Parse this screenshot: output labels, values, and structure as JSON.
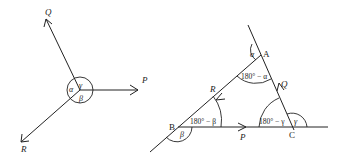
{
  "left_figure": {
    "vectors": [
      {
        "name": "P",
        "label": "P"
      },
      {
        "name": "Q",
        "label": "Q"
      },
      {
        "name": "R",
        "label": "R"
      }
    ],
    "angles": {
      "alpha": "α",
      "beta": "β",
      "gamma": "γ"
    }
  },
  "right_figure": {
    "vertices": {
      "A": "A",
      "B": "B",
      "C": "C"
    },
    "vectors": {
      "P": "P",
      "Q": "Q",
      "R": "R"
    },
    "angles": {
      "alpha_ext": "α",
      "beta_ext": "β",
      "gamma_ext": "γ",
      "alpha_int": "180° − α",
      "beta_int": "180° − β",
      "gamma_int": "180° − γ"
    }
  },
  "colors": {
    "line": "#222222",
    "background": "#ffffff"
  }
}
